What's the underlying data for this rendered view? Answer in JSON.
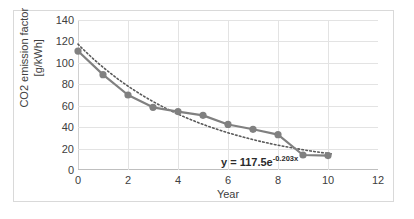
{
  "chart_data": {
    "type": "line",
    "title": "",
    "xlabel": "Year",
    "ylabel": "CO2 emission factor [g/kWh]",
    "ylabel_line1": "CO2 emission factor",
    "ylabel_line2": "[g/kWh]",
    "xlim": [
      0,
      12
    ],
    "ylim": [
      0,
      140
    ],
    "xticks": [
      0,
      2,
      4,
      6,
      8,
      10,
      12
    ],
    "yticks": [
      0,
      20,
      40,
      60,
      80,
      100,
      120,
      140
    ],
    "grid": true,
    "legend": "none",
    "x": [
      0,
      1,
      2,
      3,
      4,
      5,
      6,
      7,
      8,
      9,
      10
    ],
    "values": [
      111,
      89,
      70,
      58.5,
      54.5,
      51,
      42.5,
      38,
      33,
      14,
      13.5
    ],
    "series": [
      {
        "name": "CO2 emission factor",
        "style": "line-marker",
        "color": "#808080",
        "marker": "circle",
        "values": [
          111,
          89,
          70,
          58.5,
          54.5,
          51,
          42.5,
          38,
          33,
          14,
          13.5
        ]
      },
      {
        "name": "Exponential trendline",
        "style": "dotted",
        "color": "#595959",
        "equation": "y = 117.5e^(-0.203x)",
        "coefficient": 117.5,
        "exponent": -0.203
      }
    ],
    "annotations": [
      {
        "name": "trendline-equation",
        "text_main": "y = 117.5e",
        "text_exponent": "-0.203x",
        "x": 4.0,
        "y": 26
      }
    ],
    "colors": {
      "series": "#808080",
      "trendline": "#595959",
      "grid": "#e3e3e3",
      "axis": "#bfbfbf",
      "text": "#404040",
      "border": "#d9d9d9"
    }
  }
}
